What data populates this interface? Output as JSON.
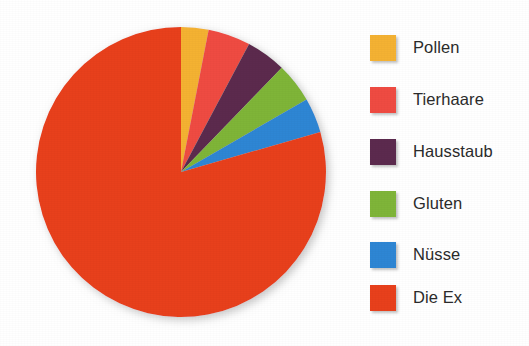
{
  "background_color": "#ffffff",
  "chart_data": {
    "type": "pie",
    "title": "",
    "subtitle": "",
    "xlabel": "",
    "ylabel": "",
    "legend_position": "right",
    "grid": false,
    "start_angle_deg": 0,
    "direction": "clockwise",
    "categories": [
      "Pollen",
      "Tierhaare",
      "Hausstaub",
      "Gluten",
      "Nüsse",
      "Die Ex"
    ],
    "values": [
      3.1,
      4.7,
      4.4,
      4.4,
      3.9,
      79.5
    ],
    "value_unit": "percent",
    "angles_deg": [
      11,
      17,
      16,
      16,
      14,
      286
    ],
    "colors": [
      "#F4B233",
      "#EF4B42",
      "#5C2A4E",
      "#7FB539",
      "#2E86D4",
      "#E8401C"
    ],
    "slices": [
      {
        "label": "Pollen",
        "color": "#F4B233",
        "value": 3.1,
        "angle_deg": 11,
        "start_deg": 0,
        "end_deg": 11
      },
      {
        "label": "Tierhaare",
        "color": "#EF4B42",
        "value": 4.7,
        "angle_deg": 17,
        "start_deg": 11,
        "end_deg": 28
      },
      {
        "label": "Hausstaub",
        "color": "#5C2A4E",
        "value": 4.4,
        "angle_deg": 16,
        "start_deg": 28,
        "end_deg": 44
      },
      {
        "label": "Gluten",
        "color": "#7FB539",
        "value": 4.4,
        "angle_deg": 16,
        "start_deg": 44,
        "end_deg": 60
      },
      {
        "label": "Nüsse",
        "color": "#2E86D4",
        "value": 3.9,
        "angle_deg": 14,
        "start_deg": 60,
        "end_deg": 74
      },
      {
        "label": "Die Ex",
        "color": "#E8401C",
        "value": 79.5,
        "angle_deg": 286,
        "start_deg": 74,
        "end_deg": 360
      }
    ],
    "geometry": {
      "center_x": 181,
      "center_y": 172,
      "radius": 145
    }
  },
  "legend": {
    "items": [
      {
        "label": "Pollen",
        "color": "#F4B233",
        "icon": "color-swatch"
      },
      {
        "label": "Tierhaare",
        "color": "#EF4B42",
        "icon": "color-swatch"
      },
      {
        "label": "Hausstaub",
        "color": "#5C2A4E",
        "icon": "color-swatch"
      },
      {
        "label": "Gluten",
        "color": "#7FB539",
        "icon": "color-swatch"
      },
      {
        "label": "Nüsse",
        "color": "#2E86D4",
        "icon": "color-swatch"
      },
      {
        "label": "Die Ex",
        "color": "#E8401C",
        "icon": "color-swatch"
      }
    ]
  }
}
